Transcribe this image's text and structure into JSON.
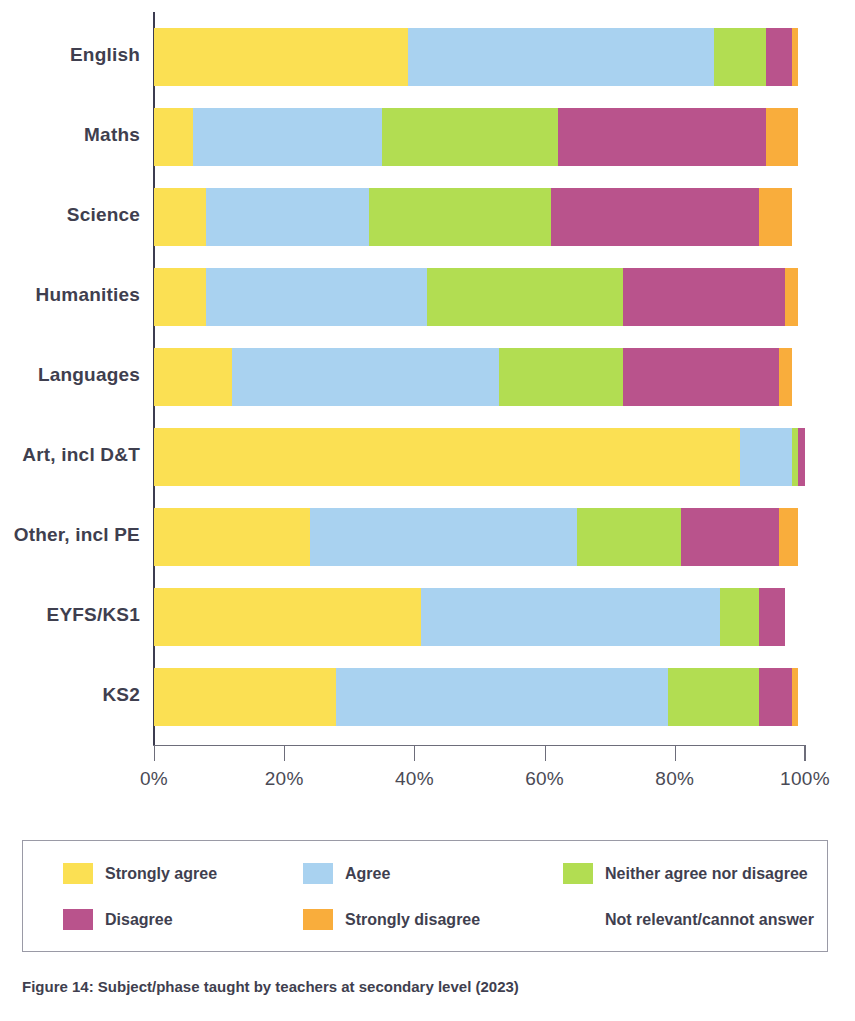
{
  "chart_data": {
    "type": "bar",
    "subtype": "stacked-horizontal-100pct",
    "title": "",
    "xlabel": "",
    "ylabel": "",
    "xlim": [
      0,
      100
    ],
    "xticks": [
      0,
      20,
      40,
      60,
      80,
      100
    ],
    "xtick_labels": [
      "0%",
      "20%",
      "40%",
      "60%",
      "80%",
      "100%"
    ],
    "grid": false,
    "legend_position": "bottom",
    "categories": [
      "English",
      "Maths",
      "Science",
      "Humanities",
      "Languages",
      "Art, incl D&T",
      "Other, incl PE",
      "EYFS/KS1",
      "KS2"
    ],
    "series": [
      {
        "name": "Strongly agree",
        "color": "#fbe053",
        "values": [
          39,
          6,
          8,
          8,
          12,
          90,
          24,
          41,
          28
        ]
      },
      {
        "name": "Agree",
        "color": "#a9d2f0",
        "values": [
          47,
          29,
          25,
          34,
          41,
          8,
          41,
          46,
          51
        ]
      },
      {
        "name": "Neither agree nor disagree",
        "color": "#b2dd52",
        "values": [
          8,
          27,
          28,
          30,
          19,
          1,
          16,
          6,
          14
        ]
      },
      {
        "name": "Disagree",
        "color": "#b9538c",
        "values": [
          4,
          32,
          32,
          25,
          24,
          1,
          15,
          4,
          5
        ]
      },
      {
        "name": "Strongly disagree",
        "color": "#f9ad3c",
        "values": [
          1,
          5,
          5,
          2,
          2,
          0,
          3,
          0,
          1
        ]
      },
      {
        "name": "Not relevant/cannot answer",
        "color": "#ffffff",
        "values": [
          0,
          0,
          0,
          0,
          0,
          0,
          0,
          0,
          0
        ]
      }
    ]
  },
  "legend": {
    "entries": [
      {
        "label": "Strongly agree",
        "color": "#fbe053"
      },
      {
        "label": "Agree",
        "color": "#a9d2f0"
      },
      {
        "label": "Neither agree nor disagree",
        "color": "#b2dd52"
      },
      {
        "label": "Disagree",
        "color": "#b9538c"
      },
      {
        "label": "Strongly disagree",
        "color": "#f9ad3c"
      },
      {
        "label": "Not relevant/cannot answer",
        "color": "none"
      }
    ]
  },
  "caption": {
    "text": "Figure 14: Subject/phase taught by teachers at secondary level (2023)"
  },
  "axis": {
    "tick_labels": [
      "0%",
      "20%",
      "40%",
      "60%",
      "80%",
      "100%"
    ]
  }
}
